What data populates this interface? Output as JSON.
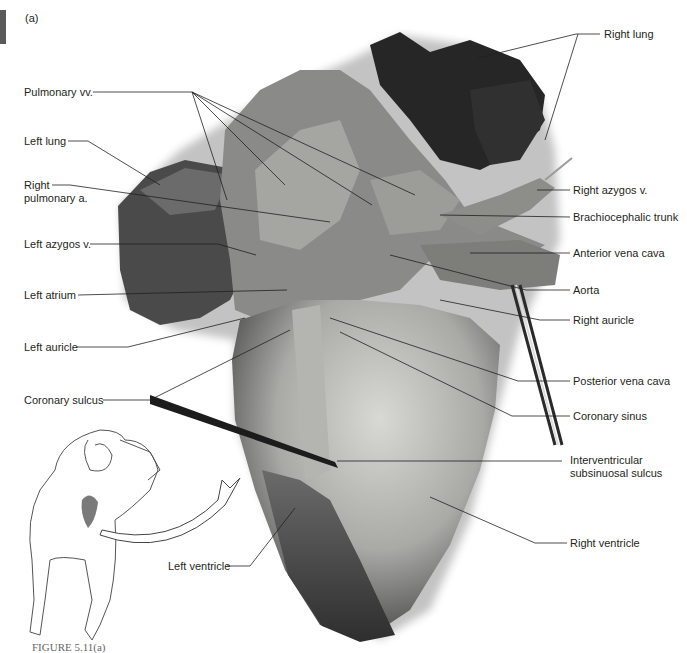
{
  "figure": {
    "panel_letter": "(a)",
    "caption": "FIGURE 5.11(a)",
    "colors": {
      "text": "#231f20",
      "leader_line": "#231f20",
      "tissue_dark": "#3a3a3a",
      "tissue_mid": "#7d7d7d",
      "tissue_light": "#b9b9b9",
      "heart_light": "#c9c9c5"
    }
  },
  "labels_left": [
    {
      "id": "pulmonary-vv",
      "text": "Pulmonary vv."
    },
    {
      "id": "left-lung",
      "text": "Left lung"
    },
    {
      "id": "right-pulmonary-a",
      "line1": "Right",
      "line2": "pulmonary a."
    },
    {
      "id": "left-azygos-v",
      "text": "Left azygos v."
    },
    {
      "id": "left-atrium",
      "text": "Left atrium"
    },
    {
      "id": "left-auricle",
      "text": "Left auricle"
    },
    {
      "id": "coronary-sulcus",
      "text": "Coronary sulcus"
    },
    {
      "id": "left-ventricle",
      "text": "Left ventricle"
    }
  ],
  "labels_right": [
    {
      "id": "right-lung",
      "text": "Right lung"
    },
    {
      "id": "right-azygos-v",
      "text": "Right azygos v."
    },
    {
      "id": "brachiocephalic-trunk",
      "text": "Brachiocephalic trunk"
    },
    {
      "id": "anterior-vena-cava",
      "text": "Anterior vena cava"
    },
    {
      "id": "aorta",
      "text": "Aorta"
    },
    {
      "id": "right-auricle",
      "text": "Right auricle"
    },
    {
      "id": "posterior-vena-cava",
      "text": "Posterior vena cava"
    },
    {
      "id": "coronary-sinus",
      "text": "Coronary sinus"
    },
    {
      "id": "interventricular-subsinuosal-sulcus",
      "line1": "Interventricular",
      "line2": "subsinuosal sulcus"
    },
    {
      "id": "right-ventricle",
      "text": "Right ventricle"
    }
  ]
}
